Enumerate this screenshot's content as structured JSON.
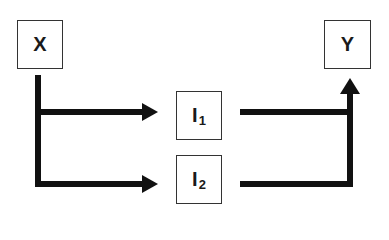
{
  "diagram": {
    "nodes": {
      "x": {
        "label": "X"
      },
      "y": {
        "label": "Y"
      },
      "i1": {
        "label": "I",
        "subscript": "1"
      },
      "i2": {
        "label": "I",
        "subscript": "2"
      }
    },
    "edges": [
      {
        "from": "X",
        "to": "I1"
      },
      {
        "from": "X",
        "to": "I2"
      },
      {
        "from": "I1",
        "to": "Y"
      },
      {
        "from": "I2",
        "to": "Y"
      }
    ]
  }
}
